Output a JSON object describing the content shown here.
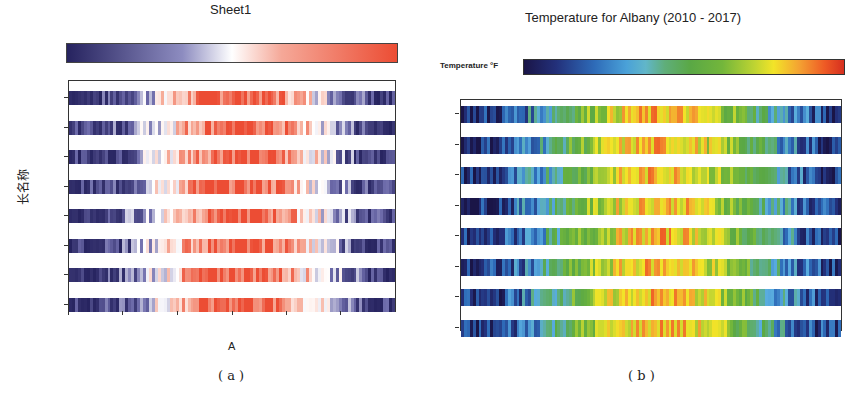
{
  "chart_data": [
    {
      "type": "heatmap",
      "panel": "a",
      "title": "Sheet1",
      "xlabel": "A",
      "ylabel": "长名称",
      "x_tick_labels": [
        "Dec",
        "Mar",
        "May",
        "Jul",
        "Sep",
        "Nov"
      ],
      "y_categories": [
        "2017",
        "2016",
        "2015",
        "2014",
        "2013",
        "2012",
        "2011",
        "2010"
      ],
      "colorbar": {
        "ticks": [
          "-5.000",
          "13.60",
          "32.20",
          "50.80",
          "69.40",
          "88.00"
        ],
        "range": [
          -5,
          88
        ],
        "colors": [
          "#26235f",
          "#ffffff",
          "#ec4d34"
        ]
      },
      "grid": false,
      "legend_position": "top"
    },
    {
      "type": "heatmap",
      "panel": "b",
      "title": "Temperature for Albany (2010 - 2017)",
      "colorbar_label": "Temperature °F",
      "top_x_tick_labels": [
        "Dec",
        "Jan",
        "Feb",
        "Mar",
        "Apr",
        "May",
        "Jun",
        "Jul",
        "Aug",
        "Sep",
        "Oct",
        "Nov"
      ],
      "bottom_x_tick_labels": [
        "Dec",
        "Jan",
        "Feb",
        "Mar",
        "Apr",
        "May",
        "Jun",
        "Jul",
        "Aug",
        "Sep",
        "Oct",
        "Nov",
        "Dec"
      ],
      "y_categories": [
        "2017",
        "2016",
        "2015",
        "2014",
        "2013",
        "2012",
        "2011",
        "2010"
      ],
      "colorbar": {
        "ticks": [
          "15",
          "30",
          "44",
          "59",
          "73",
          "88"
        ],
        "range": [
          15,
          88
        ],
        "colors": [
          "#1a1547",
          "#2e6bb8",
          "#5aa845",
          "#f2e428",
          "#ee5a25",
          "#d62f1f"
        ]
      },
      "grid": false,
      "legend_position": "top"
    }
  ],
  "panel_a": {
    "title": "Sheet1",
    "xlabel": "A",
    "ylabel": "长名称",
    "caption": "( a )",
    "colorbar_ticks": [
      "-5.000",
      "13.60",
      "32.20",
      "50.80",
      "69.40",
      "88.00"
    ],
    "years": [
      "2017",
      "2016",
      "2015",
      "2014",
      "2013",
      "2012",
      "2011",
      "2010"
    ],
    "months": [
      "Dec",
      "Mar",
      "May",
      "Jul",
      "Sep",
      "Nov"
    ]
  },
  "panel_b": {
    "title": "Temperature for Albany (2010 - 2017)",
    "colorbar_label": "Temperature °F",
    "caption": "( b )",
    "colorbar_ticks": [
      "15",
      "30",
      "44",
      "59",
      "73",
      "88"
    ],
    "years": [
      "2017",
      "2016",
      "2015",
      "2014",
      "2013",
      "2012",
      "2011",
      "2010"
    ],
    "months_top": [
      "Dec",
      "Jan",
      "Feb",
      "Mar",
      "Apr",
      "May",
      "Jun",
      "Jul",
      "Aug",
      "Sep",
      "Oct",
      "Nov"
    ],
    "months_bottom": [
      "Dec",
      "Jan",
      "Feb",
      "Mar",
      "Apr",
      "May",
      "Jun",
      "Jul",
      "Aug",
      "Sep",
      "Oct",
      "Nov",
      "Dec"
    ]
  }
}
